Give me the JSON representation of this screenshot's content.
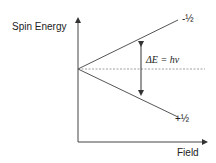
{
  "diagram": {
    "y_axis_label": "Spin Energy",
    "x_axis_label": "Field",
    "upper_level_label": "-½",
    "lower_level_label": "+½",
    "transition_label": "ΔE = hν",
    "colors": {
      "line": "#444444",
      "dashed": "#888888",
      "text": "#222222"
    }
  }
}
